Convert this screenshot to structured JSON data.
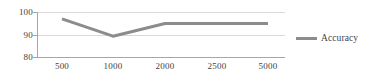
{
  "chart_data": {
    "type": "line",
    "title": "",
    "xlabel": "",
    "ylabel": "",
    "categories": [
      "500",
      "1000",
      "2000",
      "2500",
      "5000"
    ],
    "series": [
      {
        "name": "Accuracy",
        "color": "#8c8c8c",
        "values": [
          97,
          89.5,
          95,
          95,
          95
        ]
      }
    ],
    "ylim": [
      80,
      100
    ],
    "yticks": [
      "80",
      "90",
      "100"
    ],
    "ytick_values": [
      80,
      90,
      100
    ],
    "grid": true,
    "legend_position": "right",
    "legend_entries": [
      "Accuracy"
    ]
  },
  "legend": {
    "accuracy_label": "Accuracy"
  },
  "axes": {
    "y_labels": [
      "100",
      "90",
      "80"
    ],
    "x_labels": [
      "500",
      "1000",
      "2000",
      "2500",
      "5000"
    ]
  },
  "colors": {
    "series": "#8c8c8c",
    "grid": "#d9d9d9",
    "axis": "#a6a6a6",
    "text": "#3f3f3f",
    "background": "#ffffff"
  }
}
